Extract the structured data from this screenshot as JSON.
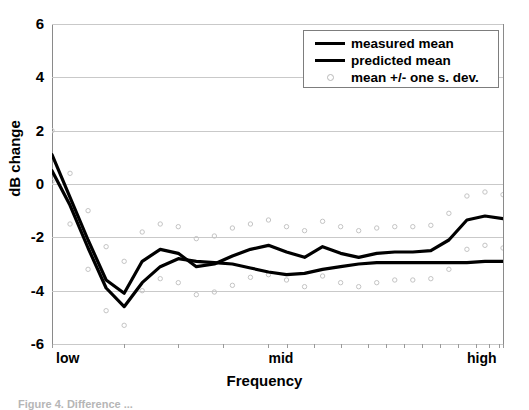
{
  "chart_data": {
    "type": "line",
    "title": "",
    "xlabel": "Frequency",
    "ylabel": "dB change",
    "ylim": [
      -6,
      6
    ],
    "yticks": [
      6,
      4,
      2,
      0,
      -2,
      -4,
      -6
    ],
    "ytick_labels": [
      "6",
      "4",
      "2",
      "0",
      "-2",
      "-4",
      "-6"
    ],
    "xlim": [
      0,
      25
    ],
    "x_axis_type": "categorical-frequency-band",
    "x_end_labels": [
      "low",
      "mid",
      "high"
    ],
    "x_end_label_positions": [
      0,
      13,
      25
    ],
    "grid": true,
    "grid_color": "#c9c9c9",
    "legend_position": "top-right",
    "legend_entries": [
      {
        "label": "measured mean",
        "marker": "line",
        "color": "#000000"
      },
      {
        "label": "predicted mean",
        "marker": "line",
        "color": "#000000"
      },
      {
        "label": "mean +/- one s. dev.",
        "marker": "circle",
        "color": "#b8b8b8"
      }
    ],
    "x": [
      0,
      1,
      2,
      3,
      4,
      5,
      6,
      7,
      8,
      9,
      10,
      11,
      12,
      13,
      14,
      15,
      16,
      17,
      18,
      19,
      20,
      21,
      22,
      23,
      24,
      25
    ],
    "series": [
      {
        "name": "measured mean",
        "color": "#000000",
        "values": [
          1.1,
          -0.5,
          -2.1,
          -3.6,
          -4.1,
          -2.9,
          -2.45,
          -2.6,
          -3.1,
          -3.0,
          -2.7,
          -2.45,
          -2.3,
          -2.55,
          -2.75,
          -2.35,
          -2.6,
          -2.75,
          -2.6,
          -2.55,
          -2.55,
          -2.5,
          -2.1,
          -1.35,
          -1.2,
          -1.3
        ]
      },
      {
        "name": "predicted mean",
        "color": "#000000",
        "values": [
          0.5,
          -0.8,
          -2.4,
          -3.9,
          -4.6,
          -3.7,
          -3.1,
          -2.8,
          -2.9,
          -2.95,
          -3.0,
          -3.15,
          -3.3,
          -3.4,
          -3.35,
          -3.2,
          -3.1,
          -3.0,
          -2.95,
          -2.95,
          -2.95,
          -2.95,
          -2.95,
          -2.95,
          -2.9,
          -2.9
        ]
      }
    ],
    "sdev_upper": {
      "name": "mean + one s. dev.",
      "values": [
        2.0,
        0.4,
        -1.0,
        -2.35,
        -2.9,
        -1.8,
        -1.5,
        -1.6,
        -2.05,
        -1.95,
        -1.65,
        -1.5,
        -1.35,
        -1.6,
        -1.75,
        -1.4,
        -1.6,
        -1.75,
        -1.65,
        -1.6,
        -1.6,
        -1.55,
        -1.1,
        -0.45,
        -0.3,
        -0.4
      ]
    },
    "sdev_lower": {
      "name": "mean - one s. dev.",
      "values": [
        0.1,
        -1.5,
        -3.2,
        -4.75,
        -5.3,
        -4.0,
        -3.55,
        -3.7,
        -4.15,
        -4.05,
        -3.8,
        -3.5,
        -3.4,
        -3.6,
        -3.85,
        -3.45,
        -3.7,
        -3.85,
        -3.7,
        -3.6,
        -3.6,
        -3.55,
        -3.2,
        -2.45,
        -2.3,
        -2.4
      ]
    },
    "xtick_positions": [
      0,
      4,
      7,
      9.5,
      12,
      13,
      14.5,
      16,
      17.5,
      18.5,
      19.5,
      20.5,
      21.5,
      22.5,
      23.5,
      24.2,
      24.8,
      25
    ]
  },
  "caption": {
    "text": "Figure 4. Difference ..."
  }
}
